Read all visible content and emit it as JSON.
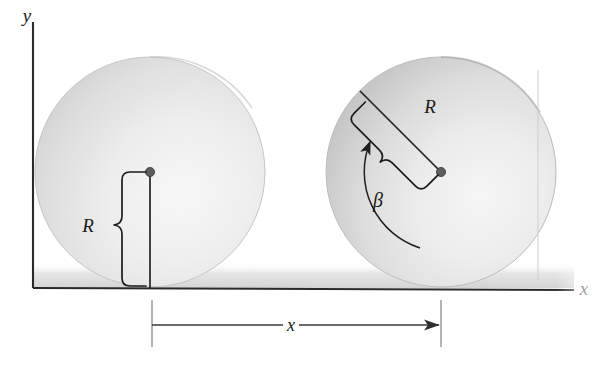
{
  "figure": {
    "background_color": "#ffffff",
    "ink_color": "#1f1f1f"
  },
  "axes": {
    "y_label": "y",
    "x_label": "x",
    "origin": {
      "x": 33,
      "y": 287
    },
    "y_axis_top": {
      "x": 33,
      "y": 22
    },
    "x_axis_right": {
      "x": 574,
      "y": 289
    },
    "y_label_pos": {
      "x": 24,
      "y": 20
    },
    "x_label_pos": {
      "x": 581,
      "y": 292
    },
    "axis_color": "#2a2a2a"
  },
  "ground": {
    "shadow_color": "#d9d9d9",
    "line_color": "#2a2a2a"
  },
  "disks": [
    {
      "name": "left-disk",
      "state": "initial",
      "center": {
        "x": 150,
        "y": 172
      },
      "radius": 115,
      "fill_light": "#f2f2f2",
      "fill_mid": "#e2e2e2",
      "fill_dark": "#cccccc",
      "hub_label": "",
      "radius_line": {
        "label": "R",
        "label_pos": {
          "x": 88,
          "y": 232
        },
        "angle_deg": 270,
        "from": {
          "x": 150,
          "y": 172
        },
        "to": {
          "x": 150,
          "y": 287
        }
      }
    },
    {
      "name": "right-disk",
      "state": "rolled",
      "center": {
        "x": 441,
        "y": 172
      },
      "radius": 115,
      "fill_light": "#f0f0f0",
      "fill_mid": "#dedede",
      "fill_dark": "#c4c4c4",
      "hub_label": "",
      "radius_line": {
        "label": "R",
        "label_pos": {
          "x": 421,
          "y": 113
        },
        "angle_deg": 135,
        "from": {
          "x": 441,
          "y": 172
        },
        "to": {
          "x": 360,
          "y": 91
        }
      },
      "angle_arc": {
        "label": "β",
        "label_pos": {
          "x": 372,
          "y": 206
        },
        "arc_radius": 78,
        "start_deg": 300,
        "end_deg": 135,
        "arrow_at": "end"
      }
    }
  ],
  "dimension": {
    "label": "x",
    "label_pos": {
      "x": 288,
      "y": 331
    },
    "line_y": 325,
    "from_x": 152,
    "to_x": 441,
    "tick_top": 300,
    "tick_bottom": 347,
    "arrow_at": "right"
  }
}
